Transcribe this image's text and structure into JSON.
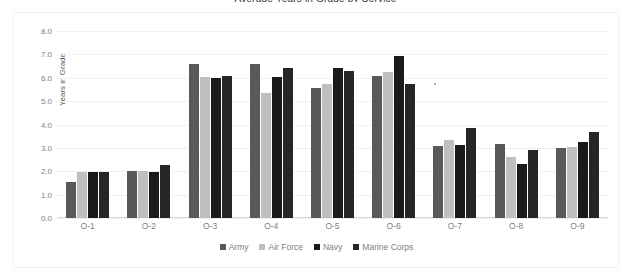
{
  "chart": {
    "title": "Average Years in Grade by Service",
    "y_axis_title": "Years in Grade"
  },
  "chart_data": {
    "type": "bar",
    "title": "Average Years in Grade by Service",
    "xlabel": "",
    "ylabel": "Years in Grade",
    "ylim": [
      0,
      8
    ],
    "yticks": [
      "0.0",
      "1.0",
      "2.0",
      "3.0",
      "4.0",
      "5.0",
      "6.0",
      "7.0",
      "8.0"
    ],
    "grid": true,
    "legend_position": "bottom",
    "categories": [
      "O-1",
      "O-2",
      "O-3",
      "O-4",
      "O-5",
      "O-6",
      "O-7",
      "O-8",
      "O-9"
    ],
    "series": [
      {
        "name": "Army",
        "color": "#595959",
        "values": [
          1.55,
          2.02,
          6.6,
          6.57,
          5.58,
          6.07,
          3.08,
          3.17,
          3.0
        ]
      },
      {
        "name": "Air Force",
        "color": "#BFBFBF",
        "values": [
          1.96,
          1.99,
          6.04,
          5.33,
          5.74,
          6.23,
          3.35,
          2.6,
          3.04
        ]
      },
      {
        "name": "Navy",
        "color": "#1A1A1A",
        "values": [
          1.96,
          1.98,
          5.98,
          6.04,
          6.43,
          6.95,
          3.12,
          2.3,
          3.26
        ]
      },
      {
        "name": "Marine Corps",
        "color": "#262626",
        "values": [
          1.97,
          2.28,
          6.07,
          6.42,
          6.3,
          5.75,
          3.83,
          2.93,
          3.66
        ]
      }
    ]
  }
}
